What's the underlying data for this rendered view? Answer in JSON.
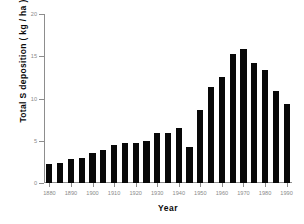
{
  "chart_data": {
    "type": "bar",
    "title": "",
    "xlabel": "Year",
    "ylabel": "Total S deposition ( kg / ha )",
    "xlim": [
      1877.5,
      1992.5
    ],
    "ylim": [
      0,
      20
    ],
    "grid": false,
    "legend": null,
    "bar_color": "#080808",
    "axis_color": "#8d8d8d",
    "tick_label_color": "#8a8a8a",
    "x_tick_labels": [
      "1880",
      "1890",
      "1900",
      "1910",
      "1920",
      "1930",
      "1940",
      "1950",
      "1960",
      "1970",
      "1980",
      "1990"
    ],
    "x_tick_values": [
      1880,
      1890,
      1900,
      1910,
      1920,
      1930,
      1940,
      1950,
      1960,
      1970,
      1980,
      1990
    ],
    "y_tick_labels": [
      "0",
      "5",
      "10",
      "15",
      "20"
    ],
    "y_tick_values": [
      0,
      5,
      10,
      15,
      20
    ],
    "categories": [
      1880,
      1885,
      1890,
      1895,
      1900,
      1905,
      1910,
      1915,
      1920,
      1925,
      1930,
      1935,
      1940,
      1945,
      1950,
      1955,
      1960,
      1965,
      1970,
      1975,
      1980,
      1985,
      1990
    ],
    "values": [
      2.2,
      2.4,
      2.8,
      3.0,
      3.6,
      3.9,
      4.5,
      4.7,
      4.7,
      5.0,
      5.9,
      5.9,
      6.5,
      4.3,
      8.6,
      11.4,
      12.6,
      15.3,
      15.9,
      14.2,
      13.4,
      10.9,
      9.4
    ]
  }
}
